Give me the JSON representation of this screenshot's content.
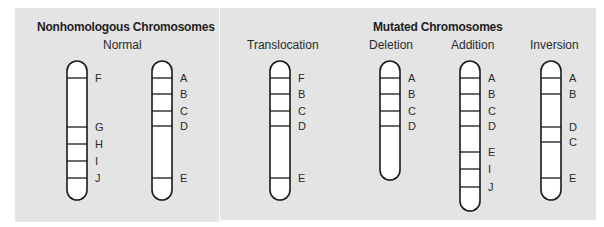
{
  "panels": {
    "left": {
      "title": "Nonhomologous Chromosomes",
      "subtitle": "Normal"
    },
    "right": {
      "title": "Mutated Chromosomes",
      "subtitles": [
        "Translocation",
        "Deletion",
        "Addition",
        "Inversion"
      ]
    }
  },
  "colors": {
    "panel_bg": "#e4e4e4",
    "chromosome_fill": "#ffffff",
    "outline": "#1a1a1a"
  },
  "chromosomes": [
    {
      "id": "normal-1",
      "group": "Normal",
      "x": 67,
      "top": 61,
      "bottom": 200,
      "bands": [
        {
          "label": "F",
          "y": 78
        },
        {
          "label": "G",
          "y": 127
        },
        {
          "label": "H",
          "y": 144
        },
        {
          "label": "I",
          "y": 161
        },
        {
          "label": "J",
          "y": 178
        }
      ]
    },
    {
      "id": "normal-2",
      "group": "Normal",
      "x": 152,
      "top": 61,
      "bottom": 200,
      "bands": [
        {
          "label": "A",
          "y": 78
        },
        {
          "label": "B",
          "y": 94
        },
        {
          "label": "C",
          "y": 111
        },
        {
          "label": "D",
          "y": 126
        },
        {
          "label": "E",
          "y": 178
        }
      ]
    },
    {
      "id": "translocation",
      "group": "Translocation",
      "x": 270,
      "top": 61,
      "bottom": 200,
      "bands": [
        {
          "label": "F",
          "y": 78
        },
        {
          "label": "B",
          "y": 94
        },
        {
          "label": "C",
          "y": 111
        },
        {
          "label": "D",
          "y": 126
        },
        {
          "label": "E",
          "y": 178
        }
      ]
    },
    {
      "id": "deletion",
      "group": "Deletion",
      "x": 380,
      "top": 61,
      "bottom": 180,
      "bands": [
        {
          "label": "A",
          "y": 78
        },
        {
          "label": "B",
          "y": 94
        },
        {
          "label": "C",
          "y": 111
        },
        {
          "label": "D",
          "y": 126
        }
      ]
    },
    {
      "id": "addition",
      "group": "Addition",
      "x": 460,
      "top": 61,
      "bottom": 211,
      "bands": [
        {
          "label": "A",
          "y": 78
        },
        {
          "label": "B",
          "y": 94
        },
        {
          "label": "C",
          "y": 111
        },
        {
          "label": "D",
          "y": 126
        },
        {
          "label": "E",
          "y": 152
        },
        {
          "label": "I",
          "y": 169
        },
        {
          "label": "J",
          "y": 187
        }
      ]
    },
    {
      "id": "inversion",
      "group": "Inversion",
      "x": 541,
      "top": 61,
      "bottom": 200,
      "bands": [
        {
          "label": "A",
          "y": 78
        },
        {
          "label": "B",
          "y": 94
        },
        {
          "label": "D",
          "y": 127
        },
        {
          "label": "C",
          "y": 142
        },
        {
          "label": "E",
          "y": 178
        }
      ]
    }
  ]
}
